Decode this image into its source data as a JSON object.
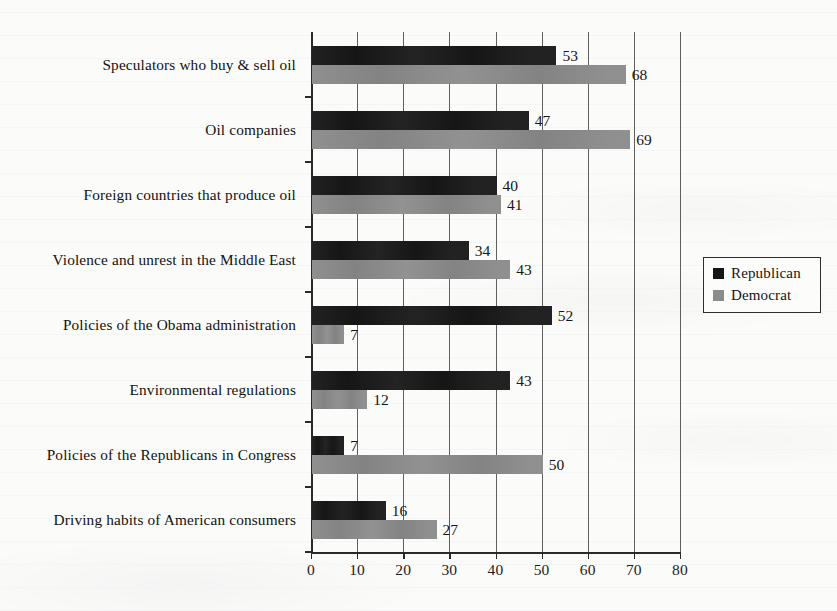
{
  "chart_data": {
    "type": "bar",
    "orientation": "horizontal",
    "title": "",
    "subtitle": "",
    "xlabel": "",
    "ylabel": "",
    "xlim": [
      0,
      80
    ],
    "xticks": [
      0,
      10,
      20,
      30,
      40,
      50,
      60,
      70,
      80
    ],
    "xtick_labels": [
      "0",
      "10",
      "20",
      "30",
      "40",
      "50",
      "60",
      "70",
      "80"
    ],
    "grid": "vertical",
    "legend_position": "right",
    "categories": [
      "Speculators who buy & sell oil",
      "Oil companies",
      "Foreign countries that produce oil",
      "Violence and unrest in the Middle East",
      "Policies of the Obama administration",
      "Environmental regulations",
      "Policies of the Republicans in Congress",
      "Driving habits of American consumers"
    ],
    "series": [
      {
        "name": "Republican",
        "color": "#161616",
        "values": [
          53,
          47,
          40,
          34,
          52,
          43,
          7,
          16
        ]
      },
      {
        "name": "Democrat",
        "color": "#838383",
        "values": [
          68,
          69,
          41,
          43,
          7,
          12,
          50,
          27
        ]
      }
    ]
  },
  "legend": {
    "entries": [
      {
        "label": "Republican",
        "swatch": "rep"
      },
      {
        "label": "Democrat",
        "swatch": "dem"
      }
    ]
  }
}
